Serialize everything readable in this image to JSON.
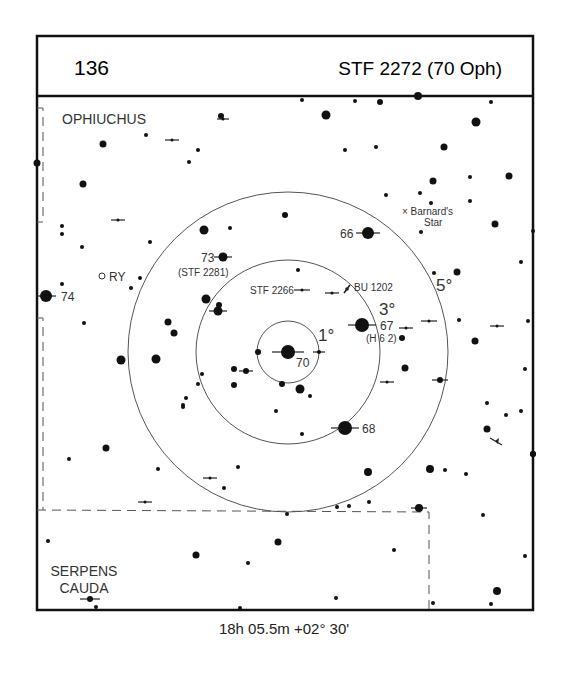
{
  "header": {
    "chart_number": "136",
    "target_name": "STF 2272 (70 Oph)"
  },
  "footer": {
    "coordinates": "18h 05.5m  +02° 30'"
  },
  "constellations": [
    {
      "name": "OPHIUCHUS",
      "x": 62,
      "y": 124
    },
    {
      "name": "SERPENS",
      "x": 84,
      "y": 576,
      "line": 1
    },
    {
      "name": "CAUDA",
      "x": 84,
      "y": 593,
      "line": 2
    }
  ],
  "field_circles": {
    "center": [
      288,
      352
    ],
    "rings": [
      {
        "label": "1°",
        "radius": 31,
        "label_x": 318,
        "label_y": 341
      },
      {
        "label": "3°",
        "radius": 92,
        "label_x": 379,
        "label_y": 315
      },
      {
        "label": "5°",
        "radius": 160,
        "label_x": 436,
        "label_y": 291
      }
    ]
  },
  "star_labels": [
    {
      "text": "70",
      "x": 296,
      "y": 367,
      "cls": "lbl"
    },
    {
      "text": "66",
      "x": 340,
      "y": 238,
      "cls": "lbl"
    },
    {
      "text": "73",
      "x": 201,
      "y": 262,
      "cls": "lbl"
    },
    {
      "text": "(STF 2281)",
      "x": 178,
      "y": 276,
      "cls": "lbl-s"
    },
    {
      "text": "74",
      "x": 61,
      "y": 301,
      "cls": "lbl"
    },
    {
      "text": "RY",
      "x": 109,
      "y": 281,
      "cls": "lbl"
    },
    {
      "text": "STF 2266",
      "x": 250,
      "y": 294,
      "cls": "lbl-s"
    },
    {
      "text": "BU 1202",
      "x": 354,
      "y": 291,
      "cls": "lbl-s"
    },
    {
      "text": "67",
      "x": 380,
      "y": 330,
      "cls": "lbl"
    },
    {
      "text": "(H 6 2)",
      "x": 366,
      "y": 342,
      "cls": "lbl-s"
    },
    {
      "text": "68",
      "x": 362,
      "y": 433,
      "cls": "lbl"
    },
    {
      "text": "× Barnard's",
      "x": 402,
      "y": 215,
      "cls": "lbl-s"
    },
    {
      "text": "Star",
      "x": 424,
      "y": 226,
      "cls": "lbl-s"
    }
  ],
  "stars": [
    {
      "x": 288,
      "y": 352,
      "r": 7,
      "bar": 16
    },
    {
      "x": 368,
      "y": 233,
      "r": 6,
      "bar": 12
    },
    {
      "x": 362,
      "y": 325,
      "r": 7,
      "bar": 14
    },
    {
      "x": 345,
      "y": 428,
      "r": 7,
      "bar": 14
    },
    {
      "x": 223,
      "y": 257,
      "r": 4.5,
      "bar": 9
    },
    {
      "x": 46,
      "y": 296,
      "r": 6,
      "bar": 10
    },
    {
      "x": 218,
      "y": 311,
      "r": 4.5,
      "bar": 9
    },
    {
      "x": 219,
      "y": 305,
      "r": 3,
      "bar": 0
    },
    {
      "x": 206,
      "y": 299,
      "r": 4.5,
      "bar": 0
    },
    {
      "x": 121,
      "y": 360,
      "r": 4.5,
      "bar": 0
    },
    {
      "x": 156,
      "y": 359,
      "r": 4.5,
      "bar": 0
    },
    {
      "x": 168,
      "y": 322,
      "r": 3.5,
      "bar": 0
    },
    {
      "x": 174,
      "y": 333,
      "r": 3.5,
      "bar": 0
    },
    {
      "x": 258,
      "y": 352,
      "r": 3,
      "bar": 0
    },
    {
      "x": 319,
      "y": 352,
      "r": 2,
      "bar": 6
    },
    {
      "x": 234,
      "y": 369,
      "r": 3,
      "bar": 0
    },
    {
      "x": 246,
      "y": 371,
      "r": 3,
      "bar": 7
    },
    {
      "x": 234,
      "y": 385,
      "r": 3,
      "bar": 0
    },
    {
      "x": 282,
      "y": 384,
      "r": 3,
      "bar": 0
    },
    {
      "x": 300,
      "y": 389,
      "r": 4.5,
      "bar": 0
    },
    {
      "x": 310,
      "y": 396,
      "r": 2,
      "bar": 0
    },
    {
      "x": 276,
      "y": 411,
      "r": 2,
      "bar": 0
    },
    {
      "x": 302,
      "y": 434,
      "r": 2,
      "bar": 0
    },
    {
      "x": 202,
      "y": 374,
      "r": 2,
      "bar": 0
    },
    {
      "x": 198,
      "y": 384,
      "r": 2,
      "bar": 0
    },
    {
      "x": 186,
      "y": 398,
      "r": 2,
      "bar": 0
    },
    {
      "x": 183,
      "y": 405,
      "r": 2,
      "bar": 0
    },
    {
      "x": 103,
      "y": 144,
      "r": 3.5,
      "bar": 0
    },
    {
      "x": 83,
      "y": 184,
      "r": 3.5,
      "bar": 0
    },
    {
      "x": 146,
      "y": 135,
      "r": 2,
      "bar": 0
    },
    {
      "x": 172,
      "y": 140,
      "r": 1.5,
      "bar": 7
    },
    {
      "x": 198,
      "y": 150,
      "r": 2,
      "bar": 0
    },
    {
      "x": 189,
      "y": 162,
      "r": 2,
      "bar": 0
    },
    {
      "x": 221,
      "y": 116,
      "r": 3,
      "bar": 0
    },
    {
      "x": 223,
      "y": 119,
      "r": 1.5,
      "bar": 6
    },
    {
      "x": 118,
      "y": 220,
      "r": 1.5,
      "bar": 7
    },
    {
      "x": 62,
      "y": 226,
      "r": 2,
      "bar": 0
    },
    {
      "x": 62,
      "y": 234,
      "r": 2,
      "bar": 0
    },
    {
      "x": 82,
      "y": 247,
      "r": 2,
      "bar": 0
    },
    {
      "x": 150,
      "y": 242,
      "r": 2,
      "bar": 0
    },
    {
      "x": 62,
      "y": 284,
      "r": 2,
      "bar": 0
    },
    {
      "x": 140,
      "y": 278,
      "r": 2,
      "bar": 0
    },
    {
      "x": 131,
      "y": 288,
      "r": 2,
      "bar": 0
    },
    {
      "x": 84,
      "y": 323,
      "r": 2,
      "bar": 0
    },
    {
      "x": 37,
      "y": 163,
      "r": 3.5,
      "bar": 0
    },
    {
      "x": 204,
      "y": 230,
      "r": 4.5,
      "bar": 0
    },
    {
      "x": 230,
      "y": 228,
      "r": 2,
      "bar": 0
    },
    {
      "x": 285,
      "y": 215,
      "r": 3,
      "bar": 0
    },
    {
      "x": 302,
      "y": 100,
      "r": 2,
      "bar": 0
    },
    {
      "x": 355,
      "y": 101,
      "r": 2,
      "bar": 0
    },
    {
      "x": 326,
      "y": 115,
      "r": 4.5,
      "bar": 0
    },
    {
      "x": 380,
      "y": 102,
      "r": 3,
      "bar": 0
    },
    {
      "x": 418,
      "y": 96,
      "r": 4,
      "bar": 0
    },
    {
      "x": 491,
      "y": 102,
      "r": 2,
      "bar": 0
    },
    {
      "x": 476,
      "y": 122,
      "r": 4.5,
      "bar": 0
    },
    {
      "x": 345,
      "y": 150,
      "r": 2,
      "bar": 0
    },
    {
      "x": 376,
      "y": 147,
      "r": 2,
      "bar": 0
    },
    {
      "x": 444,
      "y": 147,
      "r": 3.5,
      "bar": 0
    },
    {
      "x": 433,
      "y": 181,
      "r": 3.5,
      "bar": 0
    },
    {
      "x": 470,
      "y": 177,
      "r": 2,
      "bar": 0
    },
    {
      "x": 509,
      "y": 176,
      "r": 3.5,
      "bar": 0
    },
    {
      "x": 386,
      "y": 195,
      "r": 2,
      "bar": 0
    },
    {
      "x": 420,
      "y": 193,
      "r": 2,
      "bar": 0
    },
    {
      "x": 431,
      "y": 203,
      "r": 2,
      "bar": 0
    },
    {
      "x": 470,
      "y": 201,
      "r": 2,
      "bar": 0
    },
    {
      "x": 495,
      "y": 224,
      "r": 3.5,
      "bar": 0
    },
    {
      "x": 421,
      "y": 232,
      "r": 2,
      "bar": 0
    },
    {
      "x": 533,
      "y": 231,
      "r": 2,
      "bar": 0
    },
    {
      "x": 298,
      "y": 270,
      "r": 2,
      "bar": 0
    },
    {
      "x": 302,
      "y": 290,
      "r": 1.5,
      "bar": 8
    },
    {
      "x": 332,
      "y": 293,
      "r": 1.5,
      "bar": 7
    },
    {
      "x": 434,
      "y": 273,
      "r": 2,
      "bar": 0
    },
    {
      "x": 457,
      "y": 272,
      "r": 3.5,
      "bar": 0
    },
    {
      "x": 521,
      "y": 262,
      "r": 2,
      "bar": 0
    },
    {
      "x": 429,
      "y": 321,
      "r": 1.5,
      "bar": 8
    },
    {
      "x": 406,
      "y": 328,
      "r": 1.5,
      "bar": 7
    },
    {
      "x": 402,
      "y": 338,
      "r": 3,
      "bar": 0
    },
    {
      "x": 459,
      "y": 320,
      "r": 2,
      "bar": 0
    },
    {
      "x": 475,
      "y": 341,
      "r": 3.5,
      "bar": 0
    },
    {
      "x": 497,
      "y": 326,
      "r": 1.5,
      "bar": 7
    },
    {
      "x": 528,
      "y": 321,
      "r": 2,
      "bar": 0
    },
    {
      "x": 405,
      "y": 368,
      "r": 3.5,
      "bar": 0
    },
    {
      "x": 387,
      "y": 382,
      "r": 1.5,
      "bar": 7
    },
    {
      "x": 440,
      "y": 380,
      "r": 3,
      "bar": 8
    },
    {
      "x": 525,
      "y": 369,
      "r": 2,
      "bar": 0
    },
    {
      "x": 487,
      "y": 429,
      "r": 3.5,
      "bar": 0
    },
    {
      "x": 487,
      "y": 403,
      "r": 2,
      "bar": 0
    },
    {
      "x": 506,
      "y": 415,
      "r": 2,
      "bar": 0
    },
    {
      "x": 521,
      "y": 411,
      "r": 2,
      "bar": 0
    },
    {
      "x": 533,
      "y": 454,
      "r": 3,
      "bar": 0
    },
    {
      "x": 368,
      "y": 472,
      "r": 4,
      "bar": 0
    },
    {
      "x": 430,
      "y": 469,
      "r": 4,
      "bar": 0
    },
    {
      "x": 445,
      "y": 470,
      "r": 2,
      "bar": 0
    },
    {
      "x": 466,
      "y": 474,
      "r": 2,
      "bar": 0
    },
    {
      "x": 419,
      "y": 508,
      "r": 4,
      "bar": 8
    },
    {
      "x": 369,
      "y": 502,
      "r": 2,
      "bar": 0
    },
    {
      "x": 349,
      "y": 506,
      "r": 2,
      "bar": 0
    },
    {
      "x": 337,
      "y": 507,
      "r": 2,
      "bar": 0
    },
    {
      "x": 287,
      "y": 514,
      "r": 2,
      "bar": 0
    },
    {
      "x": 483,
      "y": 515,
      "r": 2,
      "bar": 0
    },
    {
      "x": 525,
      "y": 556,
      "r": 2,
      "bar": 0
    },
    {
      "x": 497,
      "y": 591,
      "r": 4,
      "bar": 0
    },
    {
      "x": 491,
      "y": 604,
      "r": 2,
      "bar": 0
    },
    {
      "x": 433,
      "y": 603,
      "r": 2,
      "bar": 0
    },
    {
      "x": 394,
      "y": 550,
      "r": 2,
      "bar": 0
    },
    {
      "x": 336,
      "y": 598,
      "r": 2,
      "bar": 0
    },
    {
      "x": 278,
      "y": 542,
      "r": 3.5,
      "bar": 0
    },
    {
      "x": 248,
      "y": 563,
      "r": 2,
      "bar": 0
    },
    {
      "x": 196,
      "y": 555,
      "r": 3.5,
      "bar": 0
    },
    {
      "x": 106,
      "y": 448,
      "r": 3.5,
      "bar": 0
    },
    {
      "x": 69,
      "y": 459,
      "r": 2,
      "bar": 0
    },
    {
      "x": 158,
      "y": 469,
      "r": 2,
      "bar": 0
    },
    {
      "x": 238,
      "y": 467,
      "r": 2,
      "bar": 0
    },
    {
      "x": 224,
      "y": 488,
      "r": 2,
      "bar": 0
    },
    {
      "x": 210,
      "y": 478,
      "r": 1.5,
      "bar": 7
    },
    {
      "x": 145,
      "y": 502,
      "r": 1.5,
      "bar": 7
    },
    {
      "x": 183,
      "y": 407,
      "r": 2,
      "bar": 0
    },
    {
      "x": 48,
      "y": 541,
      "r": 2,
      "bar": 0
    },
    {
      "x": 90,
      "y": 599,
      "r": 3,
      "bar": 10
    },
    {
      "x": 96,
      "y": 607,
      "r": 2,
      "bar": 0
    },
    {
      "x": 240,
      "y": 608,
      "r": 2,
      "bar": 0
    },
    {
      "x": 533,
      "y": 454,
      "r": 3,
      "bar": 0
    }
  ],
  "variable_star": {
    "name": "RY",
    "x": 102,
    "y": 276
  },
  "barnards_star_marker": {
    "x": 405,
    "y": 212
  },
  "boundaries": {
    "dash_color": "#555555",
    "line_color": "#111111"
  }
}
